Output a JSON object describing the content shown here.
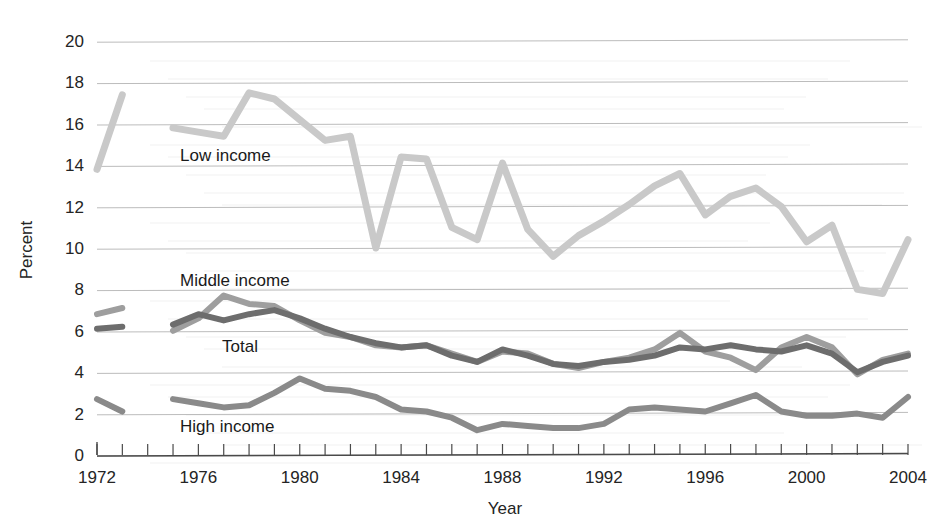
{
  "chart_data": {
    "type": "line",
    "title": "",
    "xlabel": "Year",
    "ylabel": "Percent",
    "xlim": [
      1972,
      2004
    ],
    "ylim": [
      0,
      20
    ],
    "ytick_step": 2,
    "yticks": [
      0,
      2,
      4,
      6,
      8,
      10,
      12,
      14,
      16,
      18,
      20
    ],
    "xticks_labeled": [
      1972,
      1976,
      1980,
      1984,
      1988,
      1992,
      1996,
      2000,
      2004
    ],
    "xtick_minor_step": 1,
    "grid": "horizontal",
    "legend": "inline-labels",
    "x": [
      1972,
      1973,
      1974,
      1975,
      1976,
      1977,
      1978,
      1979,
      1980,
      1981,
      1982,
      1983,
      1984,
      1985,
      1986,
      1987,
      1988,
      1989,
      1990,
      1991,
      1992,
      1993,
      1994,
      1995,
      1996,
      1997,
      1998,
      1999,
      2000,
      2001,
      2002,
      2003,
      2004
    ],
    "series": [
      {
        "name": "Low income",
        "color": "#c9c9c9",
        "values": [
          13.8,
          17.4,
          null,
          15.8,
          15.6,
          15.4,
          17.5,
          17.2,
          16.2,
          15.2,
          15.4,
          10.0,
          14.4,
          14.3,
          11.0,
          10.4,
          14.1,
          10.9,
          9.6,
          10.6,
          11.3,
          12.1,
          13.0,
          13.6,
          11.6,
          12.5,
          12.9,
          12.0,
          10.3,
          11.1,
          8.0,
          7.8,
          10.4
        ]
      },
      {
        "name": "Middle income",
        "color": "#9e9e9e",
        "values": [
          6.8,
          7.1,
          null,
          6.0,
          6.6,
          7.7,
          7.3,
          7.2,
          6.5,
          5.9,
          5.7,
          5.3,
          5.2,
          5.3,
          4.9,
          4.5,
          5.0,
          4.9,
          4.4,
          4.2,
          4.5,
          4.7,
          5.1,
          5.9,
          5.0,
          4.7,
          4.1,
          5.2,
          5.7,
          5.2,
          3.9,
          4.6,
          4.9
        ]
      },
      {
        "name": "Total",
        "color": "#6d6d6d",
        "values": [
          6.1,
          6.2,
          null,
          6.3,
          6.8,
          6.5,
          6.8,
          7.0,
          6.6,
          6.1,
          5.7,
          5.4,
          5.2,
          5.3,
          4.8,
          4.5,
          5.1,
          4.8,
          4.4,
          4.3,
          4.5,
          4.6,
          4.8,
          5.2,
          5.1,
          5.3,
          5.1,
          5.0,
          5.3,
          4.9,
          4.0,
          4.5,
          4.8
        ]
      },
      {
        "name": "High income",
        "color": "#8a8a8a",
        "values": [
          2.7,
          2.1,
          null,
          2.7,
          2.5,
          2.3,
          2.4,
          3.0,
          3.7,
          3.2,
          3.1,
          2.8,
          2.2,
          2.1,
          1.8,
          1.2,
          1.5,
          1.4,
          1.3,
          1.3,
          1.5,
          2.2,
          2.3,
          2.2,
          2.1,
          2.5,
          2.9,
          2.1,
          1.9,
          1.9,
          2.0,
          1.8,
          2.8
        ]
      }
    ]
  },
  "axis": {
    "y_title": "Percent",
    "x_title": "Year",
    "y_tick_labels": [
      "0",
      "2",
      "4",
      "6",
      "8",
      "10",
      "12",
      "14",
      "16",
      "18",
      "20"
    ],
    "x_tick_labels": [
      "1972",
      "1976",
      "1980",
      "1984",
      "1988",
      "1992",
      "1996",
      "2000",
      "2004"
    ]
  },
  "series_labels": {
    "low": "Low income",
    "middle": "Middle income",
    "total": "Total",
    "high": "High income"
  },
  "colors": {
    "low_income": "#c9c9c9",
    "middle_income": "#9e9e9e",
    "total": "#6d6d6d",
    "high_income": "#8a8a8a",
    "grid": "#bcbcbc",
    "axis": "#4a4a4a",
    "text": "#242424"
  }
}
